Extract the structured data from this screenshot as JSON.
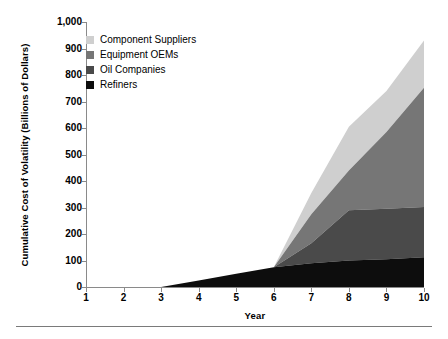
{
  "chart_data": {
    "type": "area",
    "stacked": true,
    "title": "",
    "xlabel": "Year",
    "ylabel": "Cumulative Cost of Volatility (Billions of Dollars)",
    "x": [
      1,
      2,
      3,
      4,
      5,
      6,
      7,
      8,
      9,
      10
    ],
    "xlim": [
      1,
      10
    ],
    "ylim": [
      0,
      1000
    ],
    "xticks": [
      "1",
      "2",
      "3",
      "4",
      "5",
      "6",
      "7",
      "8",
      "9",
      "10"
    ],
    "yticks": [
      "0",
      "100",
      "200",
      "300",
      "400",
      "500",
      "600",
      "700",
      "800",
      "900",
      "1,000"
    ],
    "ytick_values": [
      0,
      100,
      200,
      300,
      400,
      500,
      600,
      700,
      800,
      900,
      1000
    ],
    "grid": false,
    "legend_position": "upper-left-inside",
    "series": [
      {
        "name": "Refiners",
        "color": "#0d0d0d",
        "values": [
          0,
          0,
          0,
          25,
          50,
          75,
          90,
          100,
          105,
          112
        ]
      },
      {
        "name": "Oil Companies",
        "color": "#4a4a4a",
        "values": [
          0,
          0,
          0,
          0,
          0,
          0,
          75,
          190,
          190,
          190
        ]
      },
      {
        "name": "Equipment OEMs",
        "color": "#767676",
        "values": [
          0,
          0,
          0,
          0,
          0,
          0,
          110,
          150,
          290,
          450
        ]
      },
      {
        "name": "Component Suppliers",
        "color": "#cfcfcf",
        "values": [
          0,
          0,
          0,
          0,
          0,
          0,
          80,
          165,
          155,
          178
        ]
      }
    ],
    "cumulative_totals": [
      0,
      0,
      0,
      25,
      50,
      75,
      355,
      605,
      740,
      930
    ],
    "annotations": []
  },
  "axis": {
    "line_color": "#8a8a8a",
    "tick_color": "#8a8a8a"
  },
  "legend": {
    "items": [
      {
        "label": "Component Suppliers",
        "color": "#cfcfcf"
      },
      {
        "label": "Equipment OEMs",
        "color": "#767676"
      },
      {
        "label": "Oil Companies",
        "color": "#4a4a4a"
      },
      {
        "label": "Refiners",
        "color": "#0d0d0d"
      }
    ]
  },
  "footer": {
    "rule_color": "#7a7a7a"
  }
}
